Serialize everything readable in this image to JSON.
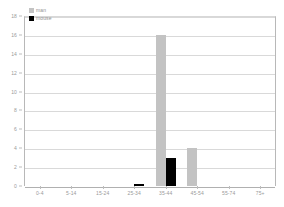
{
  "chart_data": {
    "type": "bar",
    "title": "",
    "subtitle": "",
    "xlabel": "",
    "ylabel": "",
    "grid": true,
    "legend_position": "top-left",
    "categories": [
      "0-4",
      "5-14",
      "15-24",
      "25-34",
      "35-44",
      "45-54",
      "55-74",
      "75+"
    ],
    "ylim": [
      0,
      18
    ],
    "yticks": [
      0,
      2,
      4,
      6,
      8,
      10,
      12,
      14,
      16,
      18
    ],
    "ytick_labels": [
      "0",
      "2",
      "4",
      "6",
      "8",
      "10",
      "12",
      "14",
      "16",
      "18"
    ],
    "series": [
      {
        "name": "man",
        "color": "#c3c3c3",
        "values": [
          0,
          0,
          0,
          0,
          16,
          4,
          0,
          0
        ]
      },
      {
        "name": "mouse",
        "color": "#000000",
        "values": [
          0,
          0,
          0,
          0.2,
          3,
          0,
          0,
          0
        ]
      }
    ]
  },
  "legend": {
    "items": [
      {
        "label": "man",
        "color": "#c3c3c3"
      },
      {
        "label": "mouse",
        "color": "#000000"
      }
    ]
  }
}
